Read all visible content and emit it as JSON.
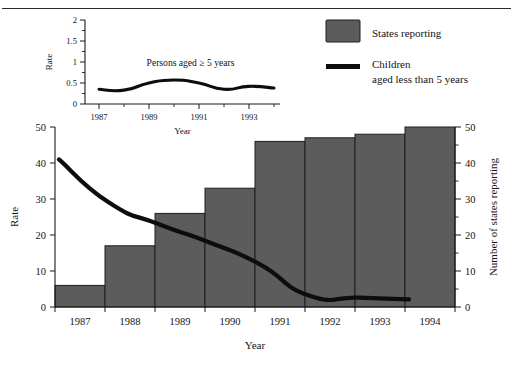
{
  "figure": {
    "background": "#ffffff",
    "rule_color": "#2b2b2b"
  },
  "legend": {
    "items": [
      {
        "label": "States reporting",
        "marker": "filled-square",
        "color": "#5c5c5c"
      },
      {
        "label": "Children",
        "label2": "aged less than 5 years",
        "marker": "thick-line",
        "color": "#0d0d0d"
      }
    ]
  },
  "chart_data": [
    {
      "id": "main",
      "type": "bar",
      "title": "",
      "xlabel": "Year",
      "ylabel": "Rate",
      "y2label": "Number of states reporting",
      "categories": [
        "1987",
        "1988",
        "1989",
        "1990",
        "1991",
        "1992",
        "1993",
        "1994"
      ],
      "ylim": [
        0,
        50
      ],
      "yticks": [
        0,
        10,
        20,
        30,
        40,
        50
      ],
      "y2lim": [
        0,
        50
      ],
      "y2ticks": [
        0,
        10,
        20,
        30,
        40,
        50
      ],
      "y2minorstep": 5,
      "grid": false,
      "legend_position": "top-right",
      "series": [
        {
          "name": "States reporting",
          "kind": "bar",
          "axis": "right",
          "color": "#5c5c5c",
          "values": [
            6,
            17,
            26,
            33,
            46,
            47,
            48,
            50
          ]
        },
        {
          "name": "Children aged less than 5 years",
          "kind": "line",
          "axis": "left",
          "color": "#0d0d0d",
          "values": [
            41,
            29,
            23,
            18,
            12,
            3.2,
            2.6,
            2.1
          ]
        }
      ]
    },
    {
      "id": "inset",
      "type": "line",
      "title": "",
      "xlabel": "Year",
      "ylabel": "Rate",
      "annotation": "Persons aged ≥ 5 years",
      "categories": [
        "1987",
        "1988",
        "1989",
        "1990",
        "1991",
        "1992",
        "1993",
        "1994"
      ],
      "xticks_labeled": [
        "1987",
        "1989",
        "1991",
        "1993"
      ],
      "ylim": [
        0,
        2
      ],
      "yticks": [
        0,
        0.5,
        1,
        1.5,
        2
      ],
      "ytick_labels": [
        "0",
        "0.5",
        "1",
        "1.5",
        "2"
      ],
      "yminorstep": 0.25,
      "grid": false,
      "series": [
        {
          "name": "Persons aged ≥ 5 years",
          "kind": "line",
          "color": "#0d0d0d",
          "values": [
            0.35,
            0.33,
            0.5,
            0.57,
            0.5,
            0.35,
            0.42,
            0.38
          ]
        }
      ]
    }
  ]
}
